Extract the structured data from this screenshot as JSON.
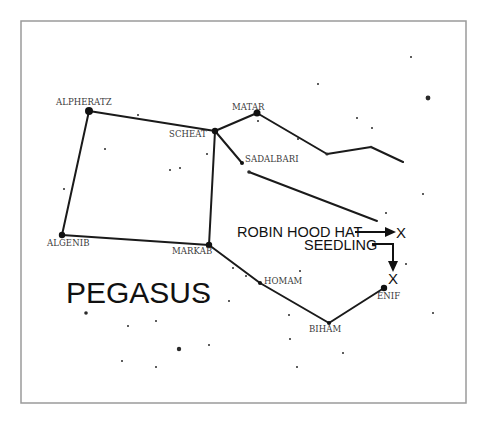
{
  "diagram": {
    "title": "PEGASUS",
    "frame": {
      "x": 21,
      "y": 21,
      "width": 445,
      "height": 382
    },
    "stars": [
      {
        "id": "alpheratz",
        "label": "ALPHERATZ",
        "x": 89,
        "y": 111,
        "r": 4,
        "label_x": 56,
        "label_y": 105
      },
      {
        "id": "scheat",
        "label": "SCHEAT",
        "x": 215,
        "y": 131,
        "r": 3.2,
        "label_x": 169,
        "label_y": 137
      },
      {
        "id": "matar",
        "label": "MATAR",
        "x": 257,
        "y": 113,
        "r": 3.5,
        "label_x": 232,
        "label_y": 110
      },
      {
        "id": "sadalbari",
        "label": "SADALBARI",
        "x": 242,
        "y": 163,
        "r": 2,
        "label_x": 245,
        "label_y": 162
      },
      {
        "id": "algenib",
        "label": "ALGENIB",
        "x": 62,
        "y": 235,
        "r": 3.2,
        "label_x": 47,
        "label_y": 246
      },
      {
        "id": "markab",
        "label": "MARKAB",
        "x": 209,
        "y": 245,
        "r": 3.2,
        "label_x": 172,
        "label_y": 254
      },
      {
        "id": "homam",
        "label": "HOMAM",
        "x": 260,
        "y": 283,
        "r": 2,
        "label_x": 264,
        "label_y": 284
      },
      {
        "id": "biham",
        "label": "BIHAM",
        "x": 329,
        "y": 323,
        "r": 2,
        "label_x": 309,
        "label_y": 332
      },
      {
        "id": "enif",
        "label": "ENIF",
        "x": 384,
        "y": 288,
        "r": 3.2,
        "label_x": 377,
        "label_y": 299
      }
    ],
    "lines": [
      [
        89,
        111,
        215,
        131
      ],
      [
        89,
        111,
        62,
        235
      ],
      [
        62,
        235,
        209,
        245
      ],
      [
        215,
        131,
        209,
        245
      ],
      [
        215,
        131,
        257,
        113
      ],
      [
        257,
        113,
        327,
        154
      ],
      [
        327,
        154,
        371,
        147
      ],
      [
        371,
        147,
        403,
        162
      ],
      [
        215,
        131,
        242,
        163
      ],
      [
        249,
        172,
        377,
        221
      ],
      [
        209,
        245,
        260,
        283
      ],
      [
        260,
        283,
        329,
        323
      ],
      [
        329,
        323,
        384,
        288
      ]
    ],
    "minor_dots": [
      [
        249,
        172,
        1.8
      ],
      [
        327,
        154,
        1.6
      ],
      [
        371,
        147,
        1.2
      ],
      [
        403,
        162,
        1.0
      ],
      [
        428,
        98,
        2.4
      ],
      [
        411,
        57,
        1.0
      ],
      [
        318,
        84,
        1.0
      ],
      [
        357,
        118,
        1.0
      ],
      [
        372,
        128,
        1.0
      ],
      [
        298,
        139,
        1.0
      ],
      [
        258,
        121,
        1.0
      ],
      [
        138,
        115,
        1.0
      ],
      [
        105,
        149,
        1.0
      ],
      [
        170,
        170,
        1.0
      ],
      [
        180,
        168,
        1.0
      ],
      [
        207,
        154,
        1.0
      ],
      [
        64,
        189,
        1.0
      ],
      [
        423,
        194,
        1.0
      ],
      [
        406,
        264,
        1.0
      ],
      [
        86,
        313,
        1.8
      ],
      [
        128,
        326,
        1.0
      ],
      [
        156,
        321,
        1.0
      ],
      [
        179,
        349,
        2.2
      ],
      [
        209,
        345,
        1.0
      ],
      [
        122,
        361,
        1.0
      ],
      [
        156,
        367,
        1.0
      ],
      [
        229,
        301,
        1.0
      ],
      [
        289,
        315,
        1.0
      ],
      [
        203,
        298,
        1.0
      ],
      [
        233,
        268,
        1.0
      ],
      [
        246,
        276,
        1.0
      ],
      [
        300,
        271,
        1.0
      ],
      [
        290,
        339,
        1.0
      ],
      [
        297,
        367,
        1.0
      ],
      [
        343,
        353,
        1.0
      ],
      [
        433,
        313,
        1.0
      ],
      [
        386,
        213,
        1.0
      ]
    ],
    "callouts": [
      {
        "id": "robin-hood-hat",
        "label": "ROBIN HOOD HAT",
        "text_x": 237,
        "text_y": 237,
        "marker": "X",
        "marker_x": 395,
        "marker_y": 238
      },
      {
        "id": "seedling",
        "label": "SEEDLING",
        "text_x": 304,
        "text_y": 250,
        "marker": "X",
        "marker_x": 388,
        "marker_y": 284
      }
    ],
    "title_pos": {
      "x": 66,
      "y": 303
    }
  }
}
